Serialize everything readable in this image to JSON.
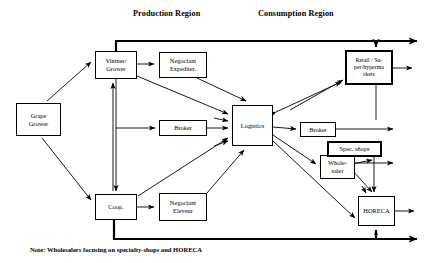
{
  "diagram": {
    "title_labels": [
      {
        "id": "production",
        "text": "Production Region",
        "x": 133,
        "y": 15
      },
      {
        "id": "consumption",
        "text": "Consumption Region",
        "x": 258,
        "y": 15
      }
    ],
    "nodes": [
      {
        "id": "grape-grower",
        "label": "Grape\nGrower",
        "x": 16,
        "y": 103,
        "w": 45,
        "h": 33,
        "bold": false
      },
      {
        "id": "vintner-grower",
        "label": "Vintner/\nGrower",
        "x": 95,
        "y": 51,
        "w": 42,
        "h": 28,
        "bold": false
      },
      {
        "id": "negociant-expediter",
        "label": "Negociant\nExpediter.",
        "x": 159,
        "y": 52,
        "w": 48,
        "h": 26,
        "bold": false
      },
      {
        "id": "broker-production",
        "label": "Broker",
        "x": 159,
        "y": 120,
        "w": 48,
        "h": 16,
        "bold": false
      },
      {
        "id": "logistics",
        "label": "Logistics",
        "x": 232,
        "y": 105,
        "w": 41,
        "h": 41,
        "bold": false
      },
      {
        "id": "coop",
        "label": "Coop.",
        "x": 95,
        "y": 194,
        "w": 42,
        "h": 26,
        "bold": false
      },
      {
        "id": "negociant-eleveur",
        "label": "Negociant\nEleveur",
        "x": 159,
        "y": 193,
        "w": 48,
        "h": 28,
        "bold": false
      },
      {
        "id": "retail-supermarkets",
        "label": "Retail / Su-\nper/hyperma\nrkets",
        "x": 345,
        "y": 50,
        "w": 48,
        "h": 35,
        "bold": true
      },
      {
        "id": "broker-consumption",
        "label": "Broker",
        "x": 300,
        "y": 122,
        "w": 36,
        "h": 15,
        "bold": false
      },
      {
        "id": "spec-shops",
        "label": "Spec. shops",
        "x": 327,
        "y": 141,
        "w": 55,
        "h": 16,
        "bold": true
      },
      {
        "id": "wholesaler",
        "label": "Whole-\nsaler",
        "x": 320,
        "y": 155,
        "w": 35,
        "h": 24,
        "bold": false
      },
      {
        "id": "horeca",
        "label": "HORECA",
        "x": 358,
        "y": 196,
        "w": 37,
        "h": 30,
        "bold": false
      }
    ],
    "note": {
      "text": "Note: Wholesalers focusing on specialty-shops and HORECA",
      "x": 30,
      "y": 246
    },
    "colors": {
      "line": "#000000",
      "background": "#ffffff",
      "box_fill": "#ffffff"
    },
    "edges": [
      {
        "from": "grape-grower",
        "to": "vintner-grower",
        "style": "thin"
      },
      {
        "from": "grape-grower",
        "to": "coop",
        "style": "thin"
      },
      {
        "from": "vintner-grower",
        "to": "negociant-expediter",
        "style": "thin"
      },
      {
        "from": "vintner-grower",
        "to": "logistics",
        "style": "thin"
      },
      {
        "from": "vintner-grower",
        "to": "coop",
        "style": "thin-bidirectional"
      },
      {
        "from": "vintner-grower",
        "to": "broker-production",
        "style": "thin"
      },
      {
        "from": "broker-production",
        "to": "logistics",
        "style": "thin"
      },
      {
        "from": "negociant-expediter",
        "to": "logistics",
        "style": "thin"
      },
      {
        "from": "coop",
        "to": "negociant-eleveur",
        "style": "thin"
      },
      {
        "from": "coop",
        "to": "logistics",
        "style": "thin"
      },
      {
        "from": "negociant-eleveur",
        "to": "logistics",
        "style": "thin"
      },
      {
        "from": "logistics",
        "to": "retail-supermarkets",
        "style": "thin-bidirectional"
      },
      {
        "from": "logistics",
        "to": "broker-consumption",
        "style": "thin"
      },
      {
        "from": "logistics",
        "to": "wholesaler",
        "style": "thin"
      },
      {
        "from": "logistics",
        "to": "horeca",
        "style": "thin"
      },
      {
        "from": "broker-consumption",
        "to": "right-edge",
        "style": "thin"
      },
      {
        "from": "spec-shops",
        "to": "right-edge",
        "style": "thin"
      },
      {
        "from": "wholesaler",
        "to": "spec-shops",
        "style": "thin"
      },
      {
        "from": "wholesaler",
        "to": "horeca",
        "style": "thin"
      },
      {
        "from": "vintner-grower",
        "to": "retail-supermarkets",
        "style": "thick-top-bypass"
      },
      {
        "from": "coop",
        "to": "horeca",
        "style": "thick-bottom-bypass"
      }
    ]
  }
}
